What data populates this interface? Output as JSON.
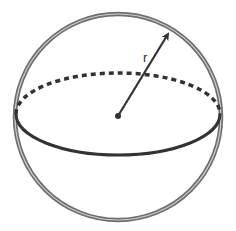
{
  "diagram": {
    "labels": {
      "radius": "r"
    },
    "elements": [
      {
        "id": "outline",
        "type": "circle",
        "description": "sphere outline"
      },
      {
        "id": "equator-back",
        "type": "half-ellipse",
        "style": "dashed",
        "description": "hidden back half of equator"
      },
      {
        "id": "equator-front",
        "type": "half-ellipse",
        "style": "solid",
        "description": "visible front half of equator"
      },
      {
        "id": "center",
        "type": "point",
        "description": "center of sphere"
      },
      {
        "id": "radius-arrow",
        "type": "arrow",
        "description": "radius from center to surface",
        "label": "r"
      }
    ],
    "colors": {
      "outline_outer": "#6e6e6e",
      "outline_inner": "#c8c8c8",
      "stroke": "#333333",
      "background": "#ffffff"
    }
  }
}
